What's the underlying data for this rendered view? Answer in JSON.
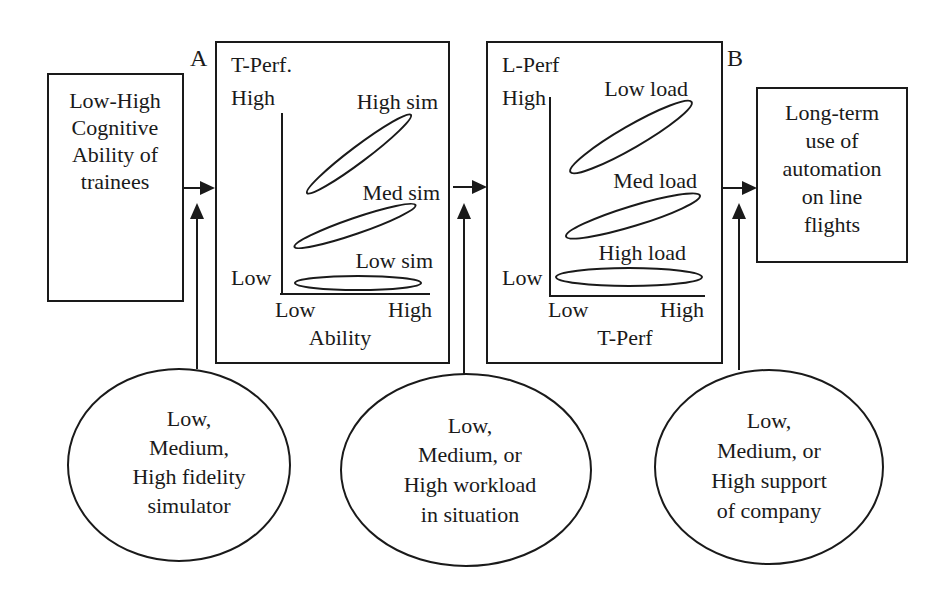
{
  "diagram": {
    "title": "",
    "colors": {
      "ink": "#1a1a1a",
      "background": "#ffffff"
    },
    "markers": {
      "A": "A",
      "B": "B"
    },
    "input_box": {
      "lines": [
        "Low-High",
        "Cognitive",
        "Ability of",
        "trainees"
      ]
    },
    "output_box": {
      "lines": [
        "Long-term",
        "use of",
        "automation",
        "on line",
        "flights"
      ]
    },
    "panel_a": {
      "y_title": "T-Perf.",
      "y_high": "High",
      "y_low": "Low",
      "x_low": "Low",
      "x_high": "High",
      "x_title": "Ability",
      "series": [
        {
          "name": "High sim",
          "label": "High sim"
        },
        {
          "name": "Med sim",
          "label": "Med sim"
        },
        {
          "name": "Low sim",
          "label": "Low sim"
        }
      ]
    },
    "panel_b": {
      "y_title": "L-Perf",
      "y_high": "High",
      "y_low": "Low",
      "x_low": "Low",
      "x_high": "High",
      "x_title": "T-Perf",
      "series": [
        {
          "name": "Low load",
          "label": "Low load"
        },
        {
          "name": "Med load",
          "label": "Med load"
        },
        {
          "name": "High load",
          "label": "High load"
        }
      ]
    },
    "moderators": [
      {
        "id": "simulator",
        "lines": [
          "Low,",
          "Medium,",
          "High fidelity",
          "simulator"
        ]
      },
      {
        "id": "workload",
        "lines": [
          "Low,",
          "Medium, or",
          "High workload",
          "in situation"
        ]
      },
      {
        "id": "support",
        "lines": [
          "Low,",
          "Medium, or",
          "High support",
          "of company"
        ]
      }
    ],
    "flow": [
      {
        "from": "input_box",
        "to": "panel_a",
        "label": "A"
      },
      {
        "from": "panel_a",
        "to": "panel_b",
        "label": ""
      },
      {
        "from": "panel_b",
        "to": "output_box",
        "label": "B"
      },
      {
        "from": "simulator",
        "to": "arrow_input_to_panel_a"
      },
      {
        "from": "workload",
        "to": "arrow_panel_a_to_panel_b"
      },
      {
        "from": "support",
        "to": "arrow_panel_b_to_output"
      }
    ]
  }
}
